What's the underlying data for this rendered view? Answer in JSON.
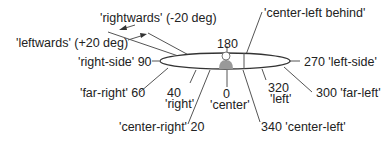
{
  "diagram": {
    "colors": {
      "line": "#555555",
      "text": "#222222",
      "person": "#999999",
      "ellipse_fill": "#ffffff"
    },
    "labels": {
      "rightwards": "'rightwards' (-20 deg)",
      "leftwards": "'leftwards' (+20 deg)",
      "right_side": "'right-side' 90",
      "far_right": "'far-right' 60",
      "right_num": "40",
      "right_word": "'right'",
      "center_right": "'center-right' 20",
      "center_num": "0",
      "center_word": "'center'",
      "center_left": "340 'center-left'",
      "left_num": "320",
      "left_word": "'left'",
      "far_left": "300 'far-left'",
      "left_side": "270 'left-side'",
      "behind_num": "180",
      "center_left_behind": "'center-left behind'"
    },
    "person_icon": "listener-head-icon"
  }
}
